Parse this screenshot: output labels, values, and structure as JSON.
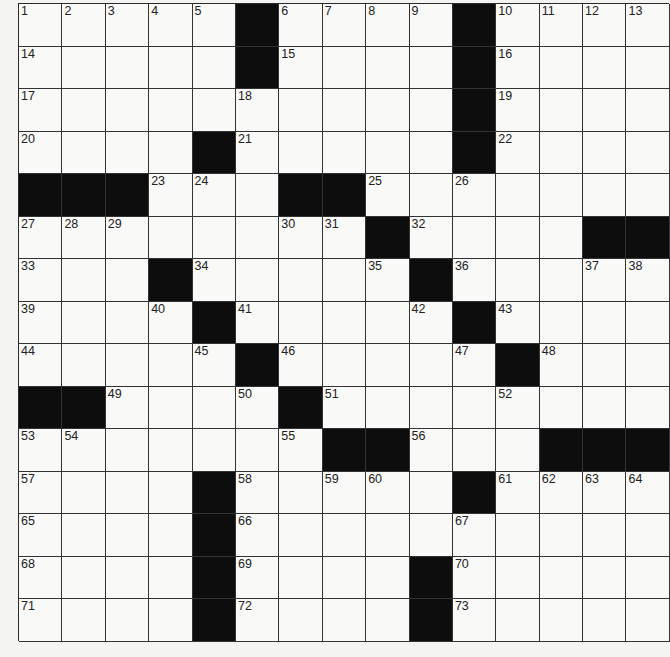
{
  "puzzle": {
    "type": "crossword",
    "rows": 15,
    "cols": 15,
    "colors": {
      "block": "#0d0d0d",
      "cell": "#f9f9f7",
      "line": "#333333",
      "background": "#f4f4f2"
    },
    "grid": [
      [
        "1",
        "2",
        "3",
        "4",
        "5",
        "#",
        "6",
        "7",
        "8",
        "9",
        "#",
        "10",
        "11",
        "12",
        "13"
      ],
      [
        "14",
        "",
        "",
        "",
        "",
        "#",
        "15",
        "",
        "",
        "",
        "#",
        "16",
        "",
        "",
        ""
      ],
      [
        "17",
        "",
        "",
        "",
        "",
        "18",
        "",
        "",
        "",
        "",
        "#",
        "19",
        "",
        "",
        ""
      ],
      [
        "20",
        "",
        "",
        "",
        "#",
        "21",
        "",
        "",
        "",
        "",
        "#",
        "22",
        "",
        "",
        ""
      ],
      [
        "#",
        "#",
        "#",
        "23",
        "24",
        "",
        "#",
        "#",
        "25",
        "",
        "26",
        "",
        "",
        "",
        ""
      ],
      [
        "27",
        "28",
        "29",
        "",
        "",
        "",
        "30",
        "31",
        "#",
        "32",
        "",
        "",
        "",
        "#",
        "#"
      ],
      [
        "33",
        "",
        "",
        "#",
        "34",
        "",
        "",
        "",
        "35",
        "#",
        "36",
        "",
        "",
        "37",
        "38"
      ],
      [
        "39",
        "",
        "",
        "40",
        "#",
        "41",
        "",
        "",
        "",
        "42",
        "#",
        "43",
        "",
        "",
        ""
      ],
      [
        "44",
        "",
        "",
        "",
        "45",
        "#",
        "46",
        "",
        "",
        "",
        "47",
        "#",
        "48",
        "",
        ""
      ],
      [
        "#",
        "#",
        "49",
        "",
        "",
        "50",
        "#",
        "51",
        "",
        "",
        "",
        "52",
        "",
        "",
        ""
      ],
      [
        "53",
        "54",
        "",
        "",
        "",
        "",
        "55",
        "#",
        "#",
        "56",
        "",
        "",
        "#",
        "#",
        "#"
      ],
      [
        "57",
        "",
        "",
        "",
        "#",
        "58",
        "",
        "59",
        "60",
        "",
        "#",
        "61",
        "62",
        "63",
        "64"
      ],
      [
        "65",
        "",
        "",
        "",
        "#",
        "66",
        "",
        "",
        "",
        "",
        "67",
        "",
        "",
        "",
        ""
      ],
      [
        "68",
        "",
        "",
        "",
        "#",
        "69",
        "",
        "",
        "",
        "#",
        "70",
        "",
        "",
        "",
        ""
      ],
      [
        "71",
        "",
        "",
        "",
        "#",
        "72",
        "",
        "",
        "",
        "#",
        "73",
        "",
        "",
        "",
        ""
      ]
    ],
    "letters": []
  }
}
